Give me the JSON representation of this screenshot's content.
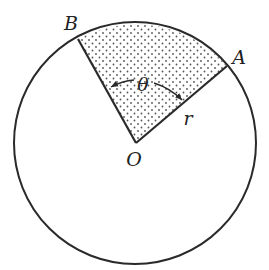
{
  "diagram": {
    "type": "circle-sector",
    "colors": {
      "stroke": "#2a2a2a",
      "dots": "#555555",
      "background": "#ffffff"
    },
    "labels": {
      "center": "O",
      "point_a": "A",
      "point_b": "B",
      "angle": "θ",
      "radius": "r"
    }
  }
}
